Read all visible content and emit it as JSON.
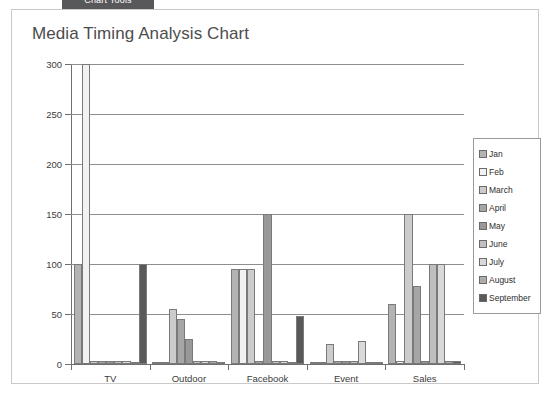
{
  "top_tab": {
    "label": "Chart Tools"
  },
  "card": {
    "title": "Media Timing Analysis Chart"
  },
  "legend": {
    "position": "right",
    "items": [
      {
        "label": "Jan",
        "color": "#b3b3b3"
      },
      {
        "label": "Feb",
        "color": "#f2f2f2"
      },
      {
        "label": "March",
        "color": "#cccccc"
      },
      {
        "label": "April",
        "color": "#a6a6a6"
      },
      {
        "label": "May",
        "color": "#999999"
      },
      {
        "label": "June",
        "color": "#bfbfbf"
      },
      {
        "label": "July",
        "color": "#d9d9d9"
      },
      {
        "label": "August",
        "color": "#adadad"
      },
      {
        "label": "September",
        "color": "#595959"
      }
    ]
  },
  "chart_data": {
    "type": "bar",
    "title": "Media Timing Analysis Chart",
    "xlabel": "",
    "ylabel": "",
    "ylim": [
      0,
      300
    ],
    "yticks": [
      0,
      50,
      100,
      150,
      200,
      250,
      300
    ],
    "grid": true,
    "categories": [
      "TV",
      "Outdoor",
      "Facebook",
      "Event",
      "Sales"
    ],
    "series": [
      {
        "name": "Jan",
        "color": "#b3b3b3",
        "values": [
          100,
          2,
          95,
          2,
          60
        ]
      },
      {
        "name": "Feb",
        "color": "#f2f2f2",
        "values": [
          300,
          2,
          95,
          2,
          3
        ]
      },
      {
        "name": "March",
        "color": "#cccccc",
        "values": [
          3,
          55,
          95,
          20,
          150
        ]
      },
      {
        "name": "April",
        "color": "#a6a6a6",
        "values": [
          3,
          45,
          3,
          3,
          78
        ]
      },
      {
        "name": "May",
        "color": "#999999",
        "values": [
          3,
          25,
          150,
          3,
          3
        ]
      },
      {
        "name": "June",
        "color": "#bfbfbf",
        "values": [
          3,
          3,
          3,
          3,
          100
        ]
      },
      {
        "name": "July",
        "color": "#d9d9d9",
        "values": [
          3,
          3,
          3,
          23,
          100
        ]
      },
      {
        "name": "August",
        "color": "#adadad",
        "values": [
          2,
          3,
          2,
          2,
          3
        ]
      },
      {
        "name": "September",
        "color": "#595959",
        "values": [
          100,
          2,
          48,
          2,
          3
        ]
      }
    ]
  }
}
